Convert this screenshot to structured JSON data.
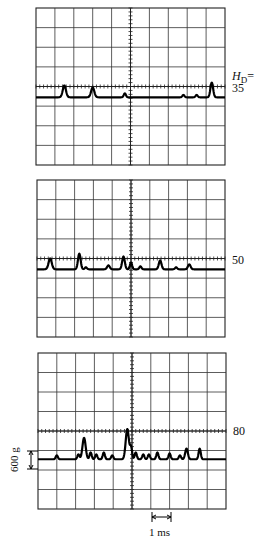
{
  "figure": {
    "hd_label": "H",
    "hd_sub": "D",
    "hd_eq": "=",
    "amplitude_scale": "600 g",
    "time_scale": "1 ms"
  },
  "chart_data": {
    "type": "line",
    "xlabel": "time (1 ms per division)",
    "ylabel": "acceleration (600 g per division)",
    "grid": true,
    "divisions": {
      "x": 10,
      "y": 8
    },
    "panels": [
      {
        "label": "35",
        "box": {
          "x": 36,
          "y": 8,
          "w": 189,
          "h": 157
        },
        "baseline_div": 4.55,
        "peaks": [
          {
            "x": 1.5,
            "h": 0.6,
            "w": 0.12
          },
          {
            "x": 3.0,
            "h": 0.5,
            "w": 0.12
          },
          {
            "x": 4.7,
            "h": 0.2,
            "w": 0.08
          },
          {
            "x": 7.8,
            "h": 0.12,
            "w": 0.08
          },
          {
            "x": 8.5,
            "h": 0.12,
            "w": 0.08
          },
          {
            "x": 9.3,
            "h": 0.75,
            "w": 0.1
          }
        ]
      },
      {
        "label": "50",
        "box": {
          "x": 37,
          "y": 180,
          "w": 188,
          "h": 157
        },
        "baseline_div": 4.55,
        "peaks": [
          {
            "x": 0.7,
            "h": 0.55,
            "w": 0.12
          },
          {
            "x": 2.25,
            "h": 0.8,
            "w": 0.1
          },
          {
            "x": 2.6,
            "h": 0.1,
            "w": 0.08
          },
          {
            "x": 3.8,
            "h": 0.2,
            "w": 0.1
          },
          {
            "x": 4.6,
            "h": 0.65,
            "w": 0.1
          },
          {
            "x": 5.0,
            "h": 0.35,
            "w": 0.08
          },
          {
            "x": 5.5,
            "h": 0.15,
            "w": 0.08
          },
          {
            "x": 6.55,
            "h": 0.45,
            "w": 0.1
          },
          {
            "x": 7.4,
            "h": 0.1,
            "w": 0.08
          },
          {
            "x": 8.1,
            "h": 0.25,
            "w": 0.1
          }
        ]
      },
      {
        "label": "80",
        "box": {
          "x": 38,
          "y": 353,
          "w": 188,
          "h": 156
        },
        "baseline_div": 5.45,
        "peaks": [
          {
            "x": 1.0,
            "h": 0.2,
            "w": 0.08
          },
          {
            "x": 2.15,
            "h": 0.25,
            "w": 0.08
          },
          {
            "x": 2.45,
            "h": 1.1,
            "w": 0.12
          },
          {
            "x": 2.8,
            "h": 0.35,
            "w": 0.08
          },
          {
            "x": 3.1,
            "h": 0.25,
            "w": 0.08
          },
          {
            "x": 3.5,
            "h": 0.35,
            "w": 0.08
          },
          {
            "x": 3.95,
            "h": 0.2,
            "w": 0.08
          },
          {
            "x": 4.75,
            "h": 1.55,
            "w": 0.12
          },
          {
            "x": 4.95,
            "h": 0.6,
            "w": 0.08
          },
          {
            "x": 5.2,
            "h": 0.35,
            "w": 0.08
          },
          {
            "x": 5.6,
            "h": 0.25,
            "w": 0.08
          },
          {
            "x": 5.9,
            "h": 0.25,
            "w": 0.08
          },
          {
            "x": 6.35,
            "h": 0.35,
            "w": 0.08
          },
          {
            "x": 7.0,
            "h": 0.3,
            "w": 0.08
          },
          {
            "x": 7.55,
            "h": 0.2,
            "w": 0.08
          },
          {
            "x": 7.9,
            "h": 0.55,
            "w": 0.1
          },
          {
            "x": 8.6,
            "h": 0.55,
            "w": 0.08
          }
        ]
      }
    ],
    "annotations": {
      "amplitude_bar": {
        "label": "600 g",
        "x": 31,
        "y1": 451,
        "y2": 469
      },
      "time_bar": {
        "label": "1 ms",
        "x1": 152,
        "x2": 171,
        "y": 517
      }
    }
  }
}
